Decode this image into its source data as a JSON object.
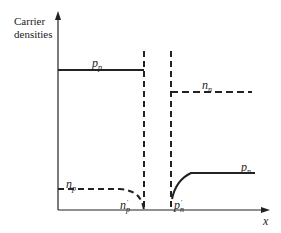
{
  "diagram": {
    "y_axis_label_line1": "Carrier",
    "y_axis_label_line2": "densities",
    "x_axis_label": "x",
    "labels": {
      "pp": {
        "main": "p",
        "sub": "p"
      },
      "nn": {
        "main": "n",
        "sub": "n"
      },
      "np": {
        "main": "n",
        "sub": "p"
      },
      "pn": {
        "main": "p",
        "sub": "n"
      },
      "np_prime": {
        "main": "n",
        "sub": "p",
        "sup": "'"
      },
      "pn_prime": {
        "main": "p",
        "sub": "n",
        "sup": "'"
      }
    },
    "colors": {
      "line": "#222222",
      "background": "#ffffff"
    }
  }
}
